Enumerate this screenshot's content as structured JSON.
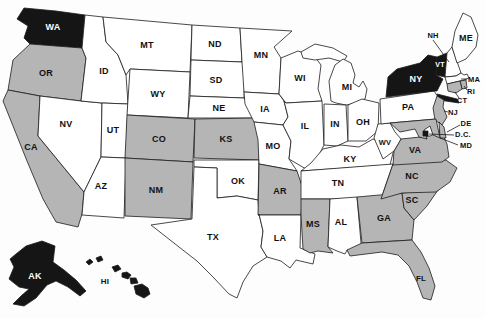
{
  "colors": {
    "black": "#151515",
    "gray": "#b5b5b5",
    "white": "#ffffff",
    "outline": "#1c1c1c",
    "background": "#fdfdfd",
    "label_dark": "#111111",
    "label_light": "#ffffff"
  },
  "states": {
    "WA": {
      "label": "WA",
      "fill": "black",
      "text": "light"
    },
    "OR": {
      "label": "OR",
      "fill": "gray",
      "text": "dark"
    },
    "CA": {
      "label": "CA",
      "fill": "gray",
      "text": "dark"
    },
    "NV": {
      "label": "NV",
      "fill": "white",
      "text": "dark"
    },
    "ID": {
      "label": "ID",
      "fill": "white",
      "text": "dark"
    },
    "UT": {
      "label": "UT",
      "fill": "white",
      "text": "dark"
    },
    "AZ": {
      "label": "AZ",
      "fill": "white",
      "text": "dark"
    },
    "MT": {
      "label": "MT",
      "fill": "white",
      "text": "dark"
    },
    "WY": {
      "label": "WY",
      "fill": "white",
      "text": "dark"
    },
    "CO": {
      "label": "CO",
      "fill": "gray",
      "text": "dark"
    },
    "NM": {
      "label": "NM",
      "fill": "gray",
      "text": "dark"
    },
    "ND": {
      "label": "ND",
      "fill": "white",
      "text": "dark"
    },
    "SD": {
      "label": "SD",
      "fill": "white",
      "text": "dark"
    },
    "NE": {
      "label": "NE",
      "fill": "white",
      "text": "dark"
    },
    "KS": {
      "label": "KS",
      "fill": "gray",
      "text": "dark"
    },
    "OK": {
      "label": "OK",
      "fill": "white",
      "text": "dark"
    },
    "TX": {
      "label": "TX",
      "fill": "white",
      "text": "dark"
    },
    "MN": {
      "label": "MN",
      "fill": "white",
      "text": "dark"
    },
    "IA": {
      "label": "IA",
      "fill": "white",
      "text": "dark"
    },
    "MO": {
      "label": "MO",
      "fill": "white",
      "text": "dark"
    },
    "AR": {
      "label": "AR",
      "fill": "gray",
      "text": "dark"
    },
    "LA": {
      "label": "LA",
      "fill": "white",
      "text": "dark"
    },
    "WI": {
      "label": "WI",
      "fill": "white",
      "text": "dark"
    },
    "IL": {
      "label": "IL",
      "fill": "white",
      "text": "dark"
    },
    "MI": {
      "label": "MI",
      "fill": "white",
      "text": "dark"
    },
    "IN": {
      "label": "IN",
      "fill": "white",
      "text": "dark"
    },
    "OH": {
      "label": "OH",
      "fill": "white",
      "text": "dark"
    },
    "KY": {
      "label": "KY",
      "fill": "white",
      "text": "dark"
    },
    "TN": {
      "label": "TN",
      "fill": "white",
      "text": "dark"
    },
    "MS": {
      "label": "MS",
      "fill": "gray",
      "text": "dark"
    },
    "AL": {
      "label": "AL",
      "fill": "white",
      "text": "dark"
    },
    "GA": {
      "label": "GA",
      "fill": "gray",
      "text": "dark"
    },
    "FL": {
      "label": "FL",
      "fill": "gray",
      "text": "dark"
    },
    "SC": {
      "label": "SC",
      "fill": "gray",
      "text": "dark"
    },
    "NC": {
      "label": "NC",
      "fill": "gray",
      "text": "dark"
    },
    "VA": {
      "label": "VA",
      "fill": "gray",
      "text": "dark"
    },
    "WV": {
      "label": "WV",
      "fill": "white",
      "text": "dark"
    },
    "PA": {
      "label": "PA",
      "fill": "white",
      "text": "dark"
    },
    "NY": {
      "label": "NY",
      "fill": "black",
      "text": "light"
    },
    "VT": {
      "label": "VT",
      "fill": "black",
      "text": "light"
    },
    "NH": {
      "label": "NH",
      "fill": "white",
      "text": "dark"
    },
    "ME": {
      "label": "ME",
      "fill": "white",
      "text": "dark"
    },
    "MA": {
      "label": "MA",
      "fill": "white",
      "text": "dark"
    },
    "RI": {
      "label": "RI",
      "fill": "gray",
      "text": "dark"
    },
    "CT": {
      "label": "CT",
      "fill": "gray",
      "text": "dark"
    },
    "NJ": {
      "label": "NJ",
      "fill": "gray",
      "text": "dark"
    },
    "DE": {
      "label": "DE",
      "fill": "gray",
      "text": "dark"
    },
    "MD": {
      "label": "MD",
      "fill": "gray",
      "text": "dark"
    },
    "DC": {
      "label": "D.C.",
      "fill": "black",
      "text": "dark"
    },
    "AK": {
      "label": "AK",
      "fill": "black",
      "text": "light"
    },
    "HI": {
      "label": "HI",
      "fill": "black",
      "text": "dark"
    }
  }
}
